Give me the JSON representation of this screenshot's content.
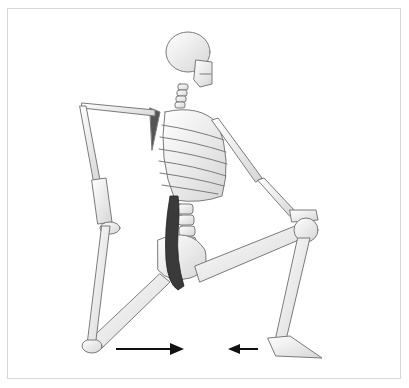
{
  "figure": {
    "caption": "",
    "highlight_color": "#3a3a3a",
    "bone_color": "#f2f2f2",
    "outline_color": "#6e6e6e",
    "arrows": [
      {
        "name": "arrow-right",
        "direction": "right",
        "x1": 116,
        "x2": 183,
        "y": 349
      },
      {
        "name": "arrow-left",
        "direction": "left",
        "x1": 258,
        "x2": 228,
        "y": 349
      }
    ]
  }
}
